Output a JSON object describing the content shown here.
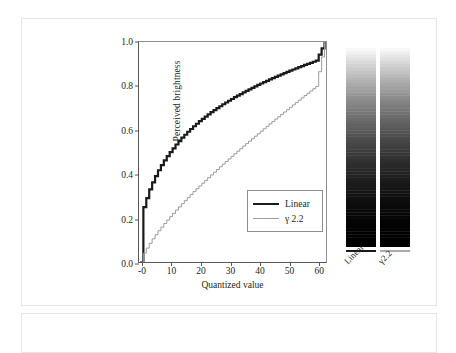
{
  "figure": {
    "name": "perceived-brightness-quantization-figure"
  },
  "chart_data": {
    "type": "line",
    "title": "",
    "xlabel": "Quantized value",
    "ylabel": "Perceived brightness",
    "xlim": [
      -1,
      63
    ],
    "ylim": [
      0.0,
      1.0
    ],
    "grid": false,
    "legend_position": "lower right",
    "xticks": [
      "-0",
      "10",
      "20",
      "30",
      "40",
      "50",
      "60"
    ],
    "xtick_values": [
      0,
      10,
      20,
      30,
      40,
      50,
      60
    ],
    "yticks": [
      "0.0",
      "0.2",
      "0.4",
      "0.6",
      "0.8",
      "1.0"
    ],
    "ytick_values": [
      0.0,
      0.2,
      0.4,
      0.6,
      0.8,
      1.0
    ],
    "series": [
      {
        "name": "Linear",
        "color": "#1a1a1a",
        "width": 2.2,
        "note": "staircase: perceived brightness of linearly quantized codes",
        "x": [
          0,
          1,
          2,
          3,
          4,
          5,
          6,
          7,
          8,
          9,
          10,
          12,
          14,
          16,
          18,
          20,
          24,
          28,
          32,
          36,
          40,
          44,
          48,
          52,
          56,
          60,
          63
        ],
        "y": [
          0.0,
          0.249,
          0.29,
          0.33,
          0.362,
          0.39,
          0.417,
          0.44,
          0.462,
          0.481,
          0.499,
          0.534,
          0.565,
          0.592,
          0.617,
          0.64,
          0.681,
          0.717,
          0.749,
          0.778,
          0.805,
          0.83,
          0.853,
          0.875,
          0.896,
          0.915,
          0.999
        ]
      },
      {
        "name": "γ 2.2",
        "color": "#9a9da1",
        "width": 1.0,
        "note": "staircase: perceived brightness of gamma-2.2 encoded codes",
        "x": [
          0,
          1,
          2,
          3,
          4,
          5,
          6,
          8,
          10,
          12,
          14,
          16,
          18,
          20,
          24,
          28,
          32,
          36,
          40,
          44,
          48,
          52,
          56,
          60,
          63
        ],
        "y": [
          0.0,
          0.04,
          0.063,
          0.085,
          0.105,
          0.124,
          0.142,
          0.175,
          0.206,
          0.236,
          0.265,
          0.293,
          0.32,
          0.346,
          0.396,
          0.445,
          0.492,
          0.538,
          0.583,
          0.628,
          0.671,
          0.714,
          0.757,
          0.798,
          0.999
        ]
      }
    ]
  },
  "legend": {
    "items": [
      {
        "label": "Linear",
        "style": "thick"
      },
      {
        "label": "γ 2.2",
        "style": "thin"
      }
    ]
  },
  "gradients": {
    "bars": [
      {
        "label": "Linear",
        "name": "linear-gradient-strip"
      },
      {
        "label": "γ2.2",
        "name": "gamma-gradient-strip"
      }
    ]
  }
}
